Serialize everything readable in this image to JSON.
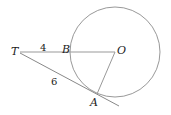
{
  "diagram": {
    "type": "geometry",
    "points": {
      "T": {
        "label": "T"
      },
      "B": {
        "label": "B"
      },
      "O": {
        "label": "O"
      },
      "A": {
        "label": "A"
      }
    },
    "segments": {
      "TB": {
        "label": "4"
      },
      "TA": {
        "label": "6"
      }
    },
    "colors": {
      "stroke": "#888888",
      "text": "#222222"
    }
  }
}
